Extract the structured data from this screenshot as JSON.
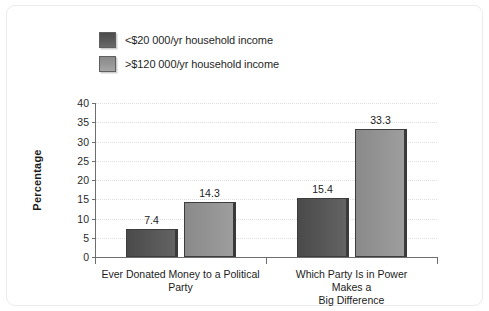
{
  "chart_data": {
    "type": "bar",
    "title": "",
    "xlabel": "",
    "ylabel": "Percentage",
    "ylim": [
      0,
      40
    ],
    "yticks": [
      0,
      5,
      10,
      15,
      20,
      25,
      30,
      35,
      40
    ],
    "ytick_labels": [
      "0",
      "5",
      "10",
      "15",
      "20",
      "25",
      "30",
      "35",
      "40"
    ],
    "grid": "horizontal-dotted",
    "legend_position": "above-plot-left",
    "categories": [
      "Ever Donated Money to a Political\nParty",
      "Which Party Is in Power Makes a\nBig Difference"
    ],
    "series": [
      {
        "name": "<$20 000/yr household income",
        "color": "#555555",
        "values": [
          7.4,
          15.4
        ],
        "value_labels": [
          "7.4",
          "15.4"
        ]
      },
      {
        "name": ">$120 000/yr household income",
        "color": "#929292",
        "values": [
          14.3,
          33.3
        ],
        "value_labels": [
          "14.3",
          "33.3"
        ]
      }
    ]
  },
  "legend": {
    "items": [
      {
        "label": "<$20 000/yr household income",
        "swatch": "dark"
      },
      {
        "label": ">$120 000/yr household income",
        "swatch": "light"
      }
    ]
  },
  "colors": {
    "series_dark": "#555555",
    "series_light": "#929292",
    "axis": "#6e6e6e",
    "grid": "#dedede",
    "frame": "#ececec",
    "text": "#1c1c1c",
    "background": "#ffffff"
  }
}
